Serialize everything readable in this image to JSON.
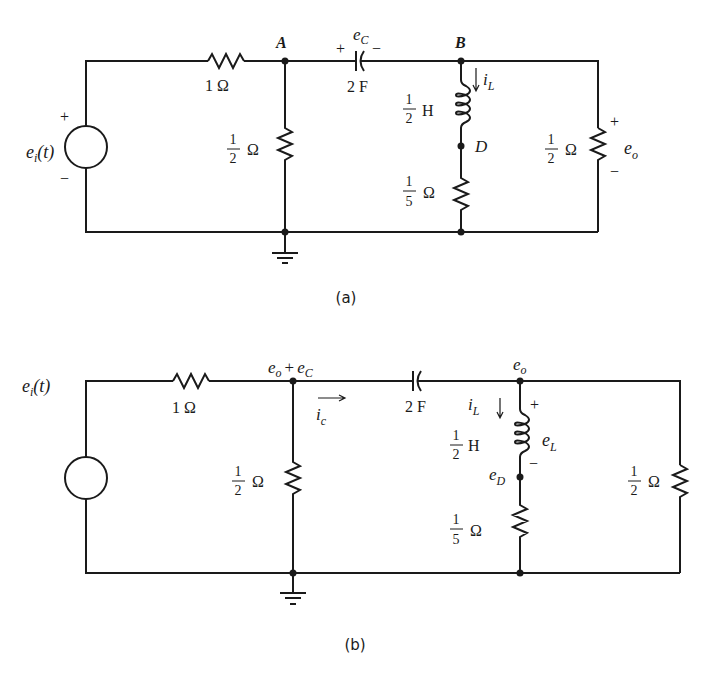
{
  "figure_a": {
    "caption": "(a)",
    "source_label": "e",
    "source_sub": "i",
    "source_arg": "(t)",
    "source_plus": "+",
    "source_minus": "−",
    "r1_label": "1 Ω",
    "node_a": "A",
    "node_b": "B",
    "node_d": "D",
    "cap_label": "2 F",
    "cap_voltage": "e",
    "cap_voltage_sub": "C",
    "cap_plus": "+",
    "cap_minus": "−",
    "r2_num": "1",
    "r2_den": "2",
    "r2_unit": "Ω",
    "l_num": "1",
    "l_den": "2",
    "l_unit": "H",
    "il_label": "i",
    "il_sub": "L",
    "r3_num": "1",
    "r3_den": "5",
    "r3_unit": "Ω",
    "r4_num": "1",
    "r4_den": "2",
    "r4_unit": "Ω",
    "eo_label": "e",
    "eo_sub": "o",
    "eo_plus": "+",
    "eo_minus": "−"
  },
  "figure_b": {
    "caption": "(b)",
    "source_label": "e",
    "source_sub": "i",
    "source_arg": "(t)",
    "r1_label": "1 Ω",
    "node1_e": "e",
    "node1_o": "o",
    "node1_plus": "+",
    "node1_e2": "e",
    "node1_c": "C",
    "ic_label": "i",
    "ic_sub": "c",
    "cap_label": "2 F",
    "node2_e": "e",
    "node2_o": "o",
    "il_label": "i",
    "il_sub": "L",
    "l_num": "1",
    "l_den": "2",
    "l_unit": "H",
    "el_label": "e",
    "el_sub": "L",
    "el_plus": "+",
    "el_minus": "−",
    "ed_label": "e",
    "ed_sub": "D",
    "r2_num": "1",
    "r2_den": "2",
    "r2_unit": "Ω",
    "r3_num": "1",
    "r3_den": "5",
    "r3_unit": "Ω",
    "r4_num": "1",
    "r4_den": "2",
    "r4_unit": "Ω"
  }
}
